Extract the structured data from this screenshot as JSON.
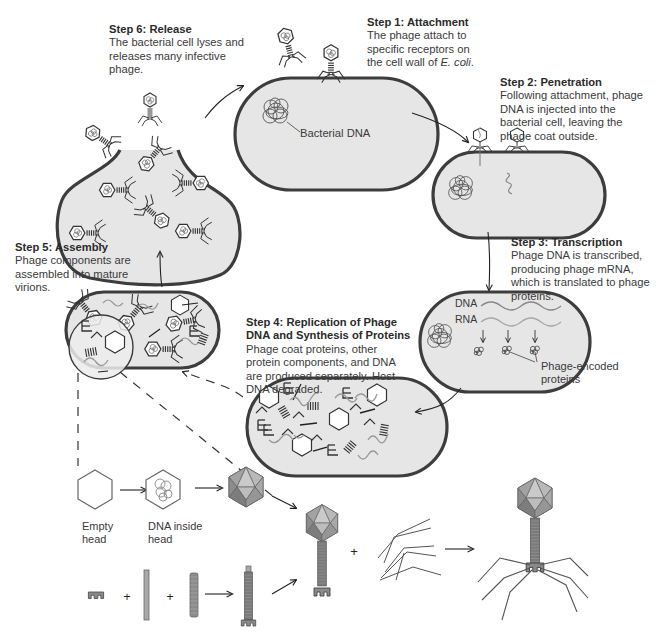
{
  "diagram": {
    "colors": {
      "cell_fill": "#e6e6e6",
      "cell_outline": "#3d3d3d",
      "phage_dna": "#8a8a8a",
      "capsid_light": "#b8b8b8",
      "capsid_dark": "#7a7a7a",
      "arrow": "#222222",
      "text": "#3a3a3a"
    }
  },
  "steps": [
    {
      "id": "step1",
      "title": "Step 1: Attachment",
      "body_pre": "The phage attach to specific receptors on the cell wall of ",
      "body_italic": "E. coli",
      "body_post": "."
    },
    {
      "id": "step2",
      "title": "Step 2: Penetration",
      "body": "Following attachment, phage DNA is injected into the bacterial cell, leaving the phage coat outside."
    },
    {
      "id": "step3",
      "title": "Step 3: Transcription",
      "body": "Phage DNA is transcribed, producing phage mRNA, which is translated to phage proteins."
    },
    {
      "id": "step4",
      "title": "Step 4: Replication of Phage DNA and Synthesis of Proteins",
      "body": "Phage coat proteins, other protein components, and DNA are produced separately. Host DNA degraded."
    },
    {
      "id": "step5",
      "title": "Step 5: Assembly",
      "body": "Phage components are assembled into mature virions."
    },
    {
      "id": "step6",
      "title": "Step 6: Release",
      "body": "The bacterial cell lyses and releases many infective phage."
    }
  ],
  "labels": {
    "bacterial_dna": "Bacterial DNA",
    "dna": "DNA",
    "rna": "RNA",
    "phage_encoded_proteins": "Phage-encoded proteins",
    "empty_head": "Empty head",
    "dna_inside_head": "DNA inside head",
    "plus": "+"
  }
}
